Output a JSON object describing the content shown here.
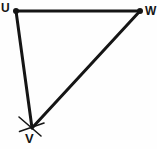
{
  "figure": {
    "kind": "geometry-construction-diagram",
    "shape": "triangle",
    "name": "Triangle UVW",
    "background_color": "#fefefe",
    "stroke_color": "#151515",
    "canvas": {
      "width": 157,
      "height": 149
    }
  },
  "labels": {
    "u": "U",
    "w": "W",
    "v": "V"
  },
  "vertices": [
    {
      "id": "U",
      "label": "U",
      "x": 16,
      "y": 11,
      "dot": true,
      "dot_radius": 3.0,
      "label_x": 1,
      "label_y": 2
    },
    {
      "id": "W",
      "label": "W",
      "x": 140,
      "y": 11,
      "dot": true,
      "dot_radius": 3.0,
      "label_x": 145,
      "label_y": 5
    },
    {
      "id": "V",
      "label": "V",
      "x": 32,
      "y": 128,
      "dot": false,
      "dot_radius": 0,
      "label_x": 25,
      "label_y": 133
    }
  ],
  "edges": [
    {
      "id": "UW",
      "from": "U",
      "to": "W",
      "x1": 16,
      "y1": 11,
      "x2": 140,
      "y2": 11,
      "stroke_width": 3.0
    },
    {
      "id": "UV",
      "from": "U",
      "to": "V",
      "x1": 16,
      "y1": 11,
      "x2": 32,
      "y2": 128,
      "stroke_width": 3.0
    },
    {
      "id": "VW",
      "from": "V",
      "to": "W",
      "x1": 32,
      "y1": 128,
      "x2": 140,
      "y2": 11,
      "stroke_width": 3.0
    }
  ],
  "construction_marks": [
    {
      "id": "arc-mark-1",
      "at_vertex": "V",
      "x1": 19,
      "y1": 117,
      "x2": 41,
      "y2": 135,
      "stroke_width": 1.6
    },
    {
      "id": "arc-mark-2",
      "at_vertex": "V",
      "x1": 20,
      "y1": 131,
      "x2": 44,
      "y2": 124,
      "stroke_width": 1.6
    }
  ],
  "colors": {
    "stroke": "#151515",
    "label": "#151515",
    "background": "#fefefe"
  }
}
